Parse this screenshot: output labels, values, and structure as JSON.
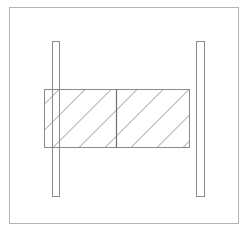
{
  "diagram": {
    "canvas": {
      "width": 244,
      "height": 231,
      "background": "#ffffff"
    },
    "stroke_color": "#8a8a8a",
    "hatch_color": "#8a8a8a",
    "outer_frame": {
      "x": 9.5,
      "y": 7.5,
      "width": 229,
      "height": 216,
      "color": "#b4b4b4"
    },
    "plates": [
      {
        "id": "left-plate",
        "x": 52.5,
        "y": 41.5,
        "width": 7,
        "height": 155
      },
      {
        "id": "right-plate",
        "x": 196.5,
        "y": 41.5,
        "width": 8,
        "height": 155
      }
    ],
    "block": {
      "x": 44.5,
      "y": 89.5,
      "width": 145,
      "height": 58,
      "divider_x": 116.5,
      "divider_color": "#6e6e6e",
      "hatch_spacing": 26,
      "hatch_angle_deg": 45
    }
  }
}
